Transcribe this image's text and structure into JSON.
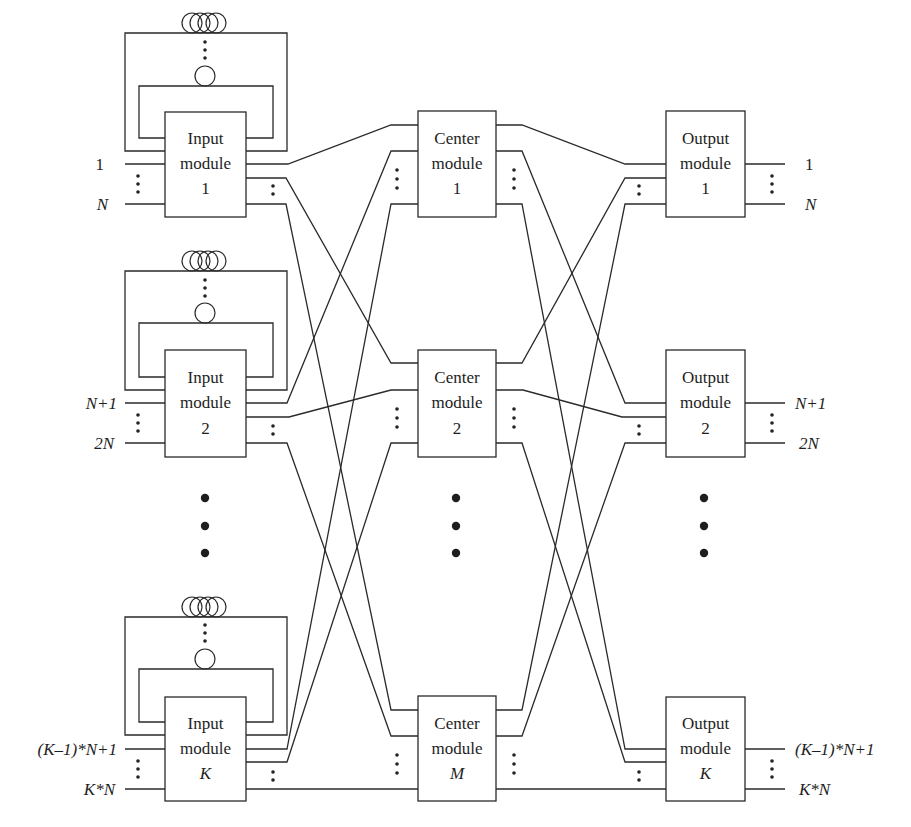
{
  "figure": {
    "type": "three-stage switch network with recirculating delay loops",
    "input_modules": [
      {
        "line1": "Input",
        "line2": "module",
        "index": "1",
        "index_italic": false,
        "top_port": "1",
        "bottom_port": "N"
      },
      {
        "line1": "Input",
        "line2": "module",
        "index": "2",
        "index_italic": false,
        "top_port": "N+1",
        "bottom_port": "2N"
      },
      {
        "line1": "Input",
        "line2": "module",
        "index": "K",
        "index_italic": true,
        "top_port": "(K–1)*N+1",
        "bottom_port": "K*N"
      }
    ],
    "center_modules": [
      {
        "line1": "Center",
        "line2": "module",
        "index": "1",
        "index_italic": false
      },
      {
        "line1": "Center",
        "line2": "module",
        "index": "2",
        "index_italic": false
      },
      {
        "line1": "Center",
        "line2": "module",
        "index": "M",
        "index_italic": true
      }
    ],
    "output_modules": [
      {
        "line1": "Output",
        "line2": "module",
        "index": "1",
        "index_italic": false,
        "top_port": "1",
        "bottom_port": "N"
      },
      {
        "line1": "Output",
        "line2": "module",
        "index": "2",
        "index_italic": false,
        "top_port": "N+1",
        "bottom_port": "2N"
      },
      {
        "line1": "Output",
        "line2": "module",
        "index": "K",
        "index_italic": true,
        "top_port": "(K–1)*N+1",
        "bottom_port": "K*N"
      }
    ],
    "delay_loop": {
      "coil_turns": 4,
      "single_loop": 1
    },
    "ellipsis": "⋮",
    "colors": {
      "line": "#2a2a2a",
      "background": "#ffffff"
    }
  }
}
